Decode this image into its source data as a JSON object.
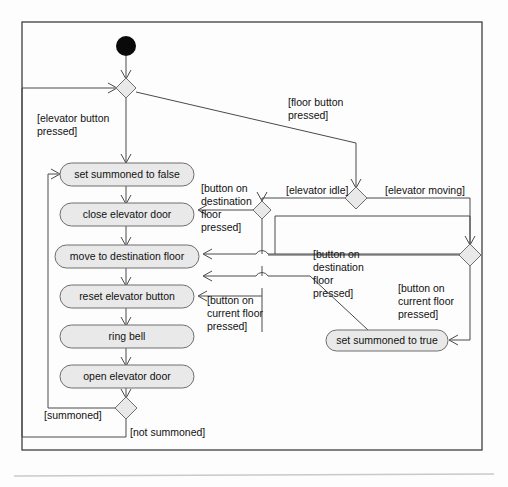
{
  "diagram": {
    "type": "uml-activity-diagram",
    "colors": {
      "node_fill": "#e9e9e9",
      "node_stroke": "#6e6e6e",
      "edge_stroke": "#4a4a4a",
      "start_node": "#0a0a0a",
      "frame_stroke": "#2f2f2f",
      "background": "#fdfdfd",
      "separator": "#c9c9c9"
    },
    "start_node": {
      "name": "initial-node",
      "cx": 126,
      "cy": 46,
      "r": 10
    },
    "activities": [
      {
        "id": "set_false",
        "label": "set summoned to false",
        "x": 60,
        "y": 163,
        "w": 134,
        "h": 23
      },
      {
        "id": "close_door",
        "label": "close elevator door",
        "x": 60,
        "y": 203,
        "w": 134,
        "h": 23
      },
      {
        "id": "move_floor",
        "label": "move to destination floor",
        "x": 55,
        "y": 245,
        "w": 144,
        "h": 23
      },
      {
        "id": "reset_btn",
        "label": "reset elevator button",
        "x": 60,
        "y": 285,
        "w": 134,
        "h": 23
      },
      {
        "id": "ring_bell",
        "label": "ring bell",
        "x": 60,
        "y": 325,
        "w": 134,
        "h": 23
      },
      {
        "id": "open_door",
        "label": "open elevator door",
        "x": 60,
        "y": 365,
        "w": 134,
        "h": 23
      },
      {
        "id": "set_true",
        "label": "set summoned to true",
        "x": 326,
        "y": 330,
        "w": 122,
        "h": 21
      }
    ],
    "decisions": [
      {
        "id": "d_top",
        "name": "decision-top",
        "cx": 126,
        "cy": 88,
        "rx": 10,
        "ry": 10
      },
      {
        "id": "d_mid",
        "name": "decision-elevator-state",
        "cx": 356,
        "cy": 198,
        "rx": 11,
        "ry": 11
      },
      {
        "id": "d_left",
        "name": "decision-merge-left",
        "cx": 262,
        "cy": 210,
        "rx": 9,
        "ry": 9
      },
      {
        "id": "d_right",
        "name": "decision-moving-branch",
        "cx": 470,
        "cy": 255,
        "rx": 11,
        "ry": 11
      },
      {
        "id": "d_bottom",
        "name": "decision-summoned",
        "cx": 126,
        "cy": 408,
        "rx": 11,
        "ry": 11
      }
    ],
    "guards": [
      {
        "id": "g1",
        "name": "guard-elevator-button-pressed",
        "lines": [
          "[elevator button",
          "pressed]"
        ],
        "x": 37,
        "y": 118
      },
      {
        "id": "g2",
        "name": "guard-floor-button-pressed",
        "lines": [
          "[floor button",
          "pressed]"
        ],
        "x": 288,
        "y": 102
      },
      {
        "id": "g3",
        "name": "guard-button-destination-floor-left",
        "lines": [
          "[button on",
          "destination",
          "floor",
          "pressed]"
        ],
        "x": 201,
        "y": 188
      },
      {
        "id": "g4",
        "name": "guard-elevator-idle",
        "lines": [
          "[elevator idle]"
        ],
        "x": 286,
        "y": 194
      },
      {
        "id": "g5",
        "name": "guard-elevator-moving",
        "lines": [
          "[elevator moving]"
        ],
        "x": 385,
        "y": 194
      },
      {
        "id": "g6",
        "name": "guard-button-destination-floor-right",
        "lines": [
          "[button on",
          "destination",
          "floor",
          "pressed]"
        ],
        "x": 313,
        "y": 254
      },
      {
        "id": "g7",
        "name": "guard-button-current-floor-left",
        "lines": [
          "[button on",
          "current floor",
          "pressed]"
        ],
        "x": 207,
        "y": 300
      },
      {
        "id": "g8",
        "name": "guard-button-current-floor-right",
        "lines": [
          "[button on",
          "current floor",
          "pressed]"
        ],
        "x": 398,
        "y": 288
      },
      {
        "id": "g9",
        "name": "guard-summoned",
        "lines": [
          "[summoned]"
        ],
        "x": 44,
        "y": 415
      },
      {
        "id": "g10",
        "name": "guard-not-summoned",
        "lines": [
          "[not summoned]"
        ],
        "x": 130,
        "y": 432
      }
    ],
    "frame": {
      "x": 22,
      "y": 22,
      "w": 460,
      "h": 428
    },
    "separator": {
      "x1": 14,
      "y1": 476,
      "x2": 494,
      "y2": 474
    }
  }
}
